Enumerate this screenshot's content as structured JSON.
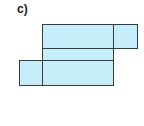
{
  "label": "c)",
  "diagram": {
    "type": "cuboid-net",
    "fill": "#c6eefa",
    "stroke": "#3a3a3a",
    "faces": [
      {
        "name": "top-face",
        "x": 42,
        "y": 24,
        "w": 71,
        "h": 24
      },
      {
        "name": "right-flap",
        "x": 113,
        "y": 24,
        "w": 24,
        "h": 24
      },
      {
        "name": "middle-strip",
        "x": 42,
        "y": 48,
        "w": 71,
        "h": 12
      },
      {
        "name": "bottom-face",
        "x": 42,
        "y": 60,
        "w": 71,
        "h": 25
      },
      {
        "name": "left-flap",
        "x": 19,
        "y": 60,
        "w": 23,
        "h": 25
      }
    ]
  }
}
